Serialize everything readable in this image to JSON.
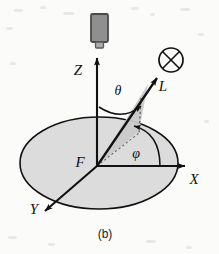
{
  "figure": {
    "caption": "(b)",
    "background_color": "#fbfbfa",
    "ink_color": "#111111",
    "plane_fill_color": "#dcdcdc",
    "wedge_fill_color": "#c9c9c9",
    "detector_fill_color": "#8f8f8f",
    "detector_edge_color": "#4a4a4a"
  },
  "axes": [
    {
      "id": "z",
      "label": "Z",
      "direction": "up",
      "label_x": 78,
      "label_y": 75
    },
    {
      "id": "x",
      "label": "X",
      "direction": "right",
      "label_x": 194,
      "label_y": 184
    },
    {
      "id": "y",
      "label": "Y",
      "direction": "down-left",
      "label_x": 34,
      "label_y": 214
    }
  ],
  "origin": {
    "label": "F",
    "label_x": 80,
    "label_y": 167,
    "x": 97,
    "y": 166
  },
  "ray": {
    "label": "L",
    "label_x": 163,
    "label_y": 91,
    "tip_x": 154,
    "tip_y": 79
  },
  "angles": [
    {
      "id": "theta",
      "label": "θ",
      "symbol_name": "theta",
      "label_x": 118,
      "label_y": 95,
      "description": "polar angle from Z axis to ray L"
    },
    {
      "id": "phi",
      "label": "φ",
      "symbol_name": "phi",
      "label_x": 136,
      "label_y": 158,
      "description": "azimuthal angle from X axis to ray projection"
    }
  ],
  "symbols": [
    {
      "id": "into-page",
      "name": "circled-cross-icon",
      "glyph": "⊗",
      "x": 171,
      "y": 60,
      "radius": 12,
      "description": "vector directed into the page"
    }
  ],
  "detector": {
    "name": "detector-camera",
    "x": 91,
    "y": 14,
    "width": 17,
    "height": 28,
    "nub_width": 8,
    "nub_height": 6
  },
  "plane": {
    "name": "xy-plane-ellipse",
    "cx": 99,
    "cy": 163,
    "rx": 79,
    "ry": 46
  }
}
